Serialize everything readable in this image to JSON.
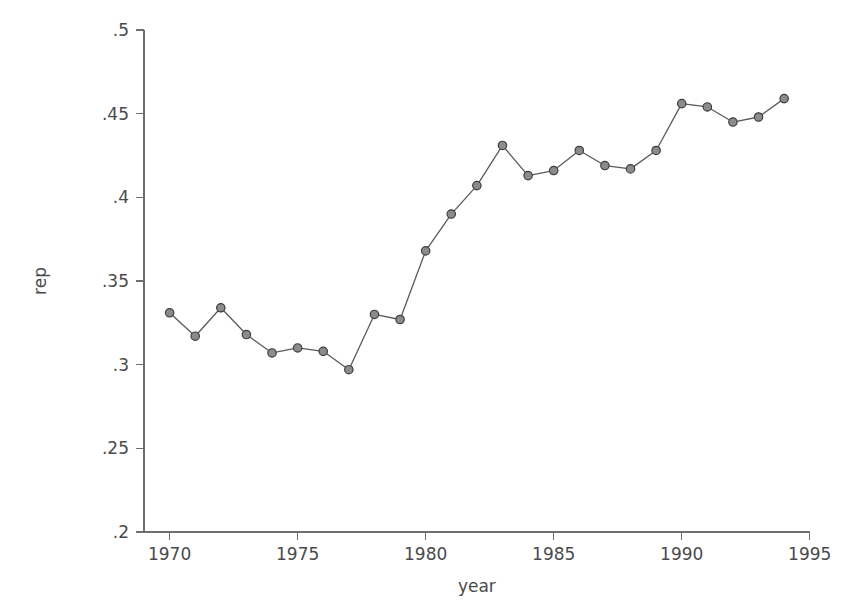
{
  "chart_data": {
    "type": "line",
    "title": "",
    "xlabel": "year",
    "ylabel": "rep",
    "xlim": [
      1969,
      1995.4
    ],
    "ylim": [
      0.2,
      0.5
    ],
    "grid": false,
    "legend": null,
    "x_ticks": [
      1970,
      1975,
      1980,
      1985,
      1990,
      1995
    ],
    "x_tick_labels": [
      "1970",
      "1975",
      "1980",
      "1985",
      "1990",
      "1995"
    ],
    "y_ticks": [
      0.2,
      0.25,
      0.3,
      0.35,
      0.4,
      0.45,
      0.5
    ],
    "y_tick_labels": [
      ".2",
      ".25",
      ".3",
      ".35",
      ".4",
      ".45",
      ".5"
    ],
    "marker": "circle",
    "line_color": "#5a5a5a",
    "marker_fill": "#8b8b8b",
    "marker_edge": "#3d3d3d",
    "axis_color": "#6e6e6e",
    "background": "#ffffff",
    "x": [
      1970,
      1971,
      1972,
      1973,
      1974,
      1975,
      1976,
      1977,
      1978,
      1979,
      1980,
      1981,
      1982,
      1983,
      1984,
      1985,
      1986,
      1987,
      1988,
      1989,
      1990,
      1991,
      1992,
      1993,
      1994
    ],
    "values": [
      0.331,
      0.317,
      0.334,
      0.318,
      0.307,
      0.31,
      0.308,
      0.297,
      0.33,
      0.327,
      0.368,
      0.39,
      0.407,
      0.431,
      0.413,
      0.416,
      0.428,
      0.419,
      0.417,
      0.428,
      0.456,
      0.454,
      0.445,
      0.448,
      0.459
    ],
    "series": [
      {
        "name": "rep",
        "values": [
          0.331,
          0.317,
          0.334,
          0.318,
          0.307,
          0.31,
          0.308,
          0.297,
          0.33,
          0.327,
          0.368,
          0.39,
          0.407,
          0.431,
          0.413,
          0.416,
          0.428,
          0.419,
          0.417,
          0.428,
          0.456,
          0.454,
          0.445,
          0.448,
          0.459
        ]
      }
    ]
  },
  "layout": {
    "plot_left": 144,
    "plot_right": 820,
    "plot_top": 30,
    "plot_bottom": 532,
    "y_axis_top": 30,
    "tick_len": 8,
    "marker_radius": 4.2
  }
}
